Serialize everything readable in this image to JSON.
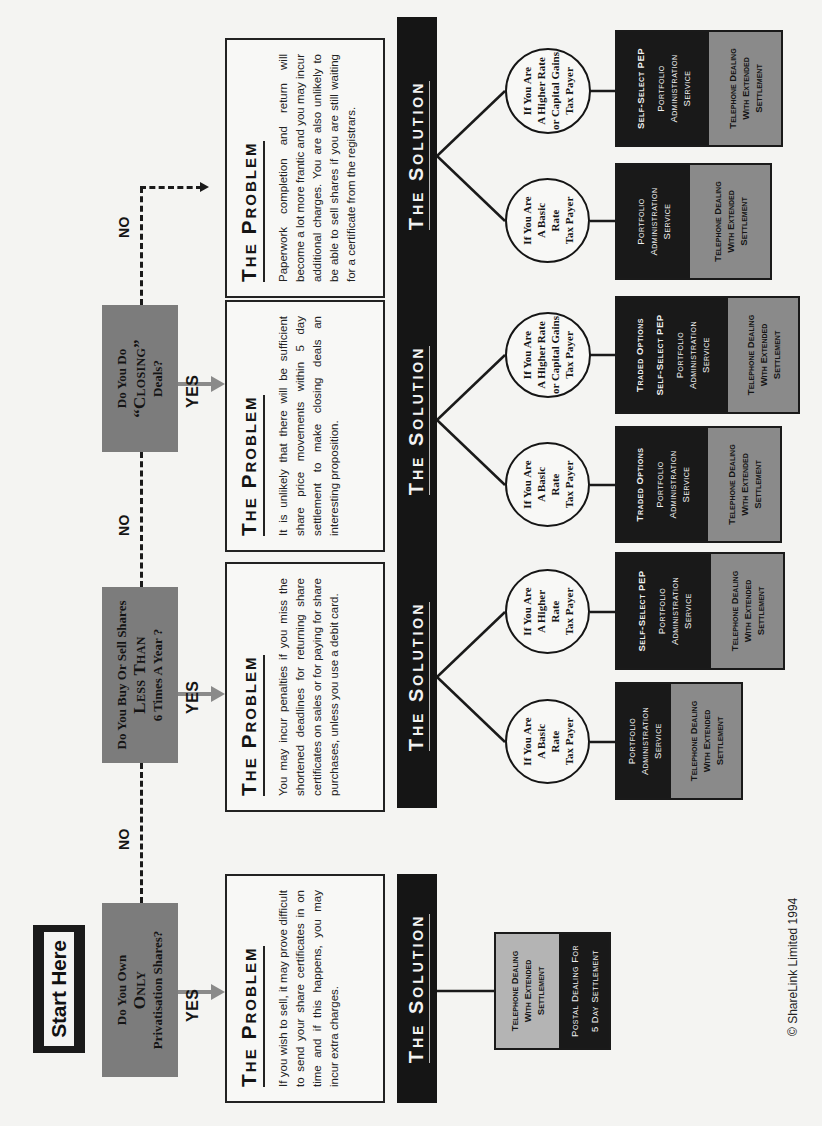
{
  "start": {
    "label": "Start Here"
  },
  "questions": [
    {
      "line1": "Do You Own",
      "big": "Only",
      "line3": "Privatisation Shares?"
    },
    {
      "line1": "Do You Buy Or Sell Shares",
      "big": "Less Than",
      "line3": "6 Times A Year ?"
    },
    {
      "line1": "Do You Do",
      "big": "“Closing”",
      "line3": "Deals?"
    }
  ],
  "labels": {
    "yes": "YES",
    "no": "NO"
  },
  "problem_title": "The Problem",
  "solution_title": "The Solution",
  "problems": [
    "If you wish to sell, it may prove difficult to send your share certificates in on time and if this happens, you may incur extra charges.",
    "You may incur penalties if you miss the shortened deadlines for returning share certificates on sales or for paying for share purchases, unless you use a debit card.",
    "It is unlikely that there will be sufficient share price movements within 5 day settlement to make closing deals an interesting proposition.",
    "Paperwork completion and return will become a lot more frantic and you may incur additional charges. You are also unlikely to be able to sell shares if you are still waiting for a certificate from the registrars."
  ],
  "circles": {
    "basic": [
      "If You Are",
      "A Basic",
      "Rate",
      "Tax Payer"
    ],
    "higher": [
      "If You Are",
      "A Higher",
      "Rate",
      "Tax Payer"
    ],
    "higher_cg": [
      "If You Are",
      "A Higher Rate",
      "or Capital Gains",
      "Tax Payer"
    ]
  },
  "solutions": {
    "col1": {
      "top": [
        "Telephone Dealing",
        "With Extended",
        "Settlement"
      ],
      "bottom": [
        "Postal Dealing For",
        "5 Day Settlement"
      ]
    },
    "col2_basic": {
      "services": [
        [
          "Portfolio",
          "Administration",
          "Service"
        ]
      ],
      "dealing": [
        "Telephone Dealing",
        "With Extended",
        "Settlement"
      ]
    },
    "col2_higher": {
      "strong": "Self-Select PEP",
      "services": [
        [
          "Portfolio",
          "Administration",
          "Service"
        ]
      ],
      "dealing": [
        "Telephone Dealing",
        "With Extended",
        "Settlement"
      ]
    },
    "col3_basic": {
      "strong": "Traded Options",
      "services": [
        [
          "Portfolio",
          "Administration",
          "Service"
        ]
      ],
      "dealing": [
        "Telephone Dealing",
        "With Extended",
        "Settlement"
      ]
    },
    "col3_higher": {
      "strong": "Traded Options",
      "strong2": "Self-Select PEP",
      "services": [
        [
          "Portfolio",
          "Administration",
          "Service"
        ]
      ],
      "dealing": [
        "Telephone Dealing",
        "With Extended",
        "Settlement"
      ]
    },
    "col4_basic": {
      "services": [
        [
          "Portfolio",
          "Administration",
          "Service"
        ]
      ],
      "dealing": [
        "Telephone Dealing",
        "With Extended",
        "Settlement"
      ]
    },
    "col4_higher": {
      "strong": "Self-Select PEP",
      "services": [
        [
          "Portfolio",
          "Administration",
          "Service"
        ]
      ],
      "dealing": [
        "Telephone Dealing",
        "With Extended",
        "Settlement"
      ]
    }
  },
  "footer": {
    "copyright": "© ShareLink Limited 1994"
  }
}
